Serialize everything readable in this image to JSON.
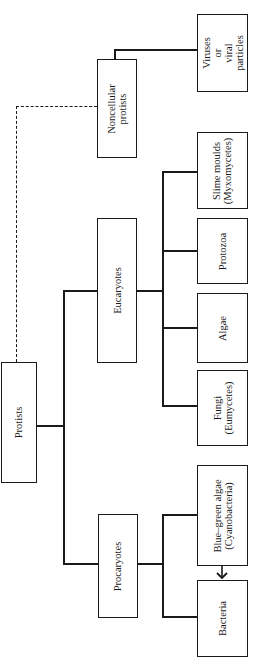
{
  "diagram": {
    "type": "taxonomy-tree",
    "orientation": "rotated-90-ccw",
    "root": {
      "label": "Protists",
      "children": [
        {
          "label": "Procaryotes",
          "children": [
            {
              "label": "Bacteria"
            },
            {
              "label": "Blue–green algae\n(Cyanobacteria)"
            }
          ]
        },
        {
          "label": "Eucaryotes",
          "children": [
            {
              "label": "Fungi\n(Eumycetes)"
            },
            {
              "label": "Algae"
            },
            {
              "label": "Protozoa"
            },
            {
              "label": "Slime moulds\n(Myxomycetes)"
            }
          ]
        },
        {
          "label": "Noncellular\nprotists",
          "link_style": "dashed",
          "children": [
            {
              "label": "Viruses\nor\nviral\nparticles"
            }
          ]
        }
      ]
    },
    "annotations": [
      {
        "type": "arrow",
        "from": "Blue–green algae (Cyanobacteria)",
        "to": "Bacteria"
      }
    ]
  },
  "nodes": {
    "protists": "Protists",
    "procaryotes": "Procaryotes",
    "eucaryotes": "Eucaryotes",
    "noncellular": "Noncellular\nprotists",
    "bacteria": "Bacteria",
    "bluegreen": "Blue–green algae\n(Cyanobacteria)",
    "fungi": "Fungi\n(Eumycetes)",
    "algae": "Algae",
    "protozoa": "Protozoa",
    "slime": "Slime moulds\n(Myxomycetes)",
    "viruses": "Viruses\nor\nviral\nparticles"
  },
  "colors": {
    "ink": "#1a1a1a",
    "background": "#ffffff"
  }
}
